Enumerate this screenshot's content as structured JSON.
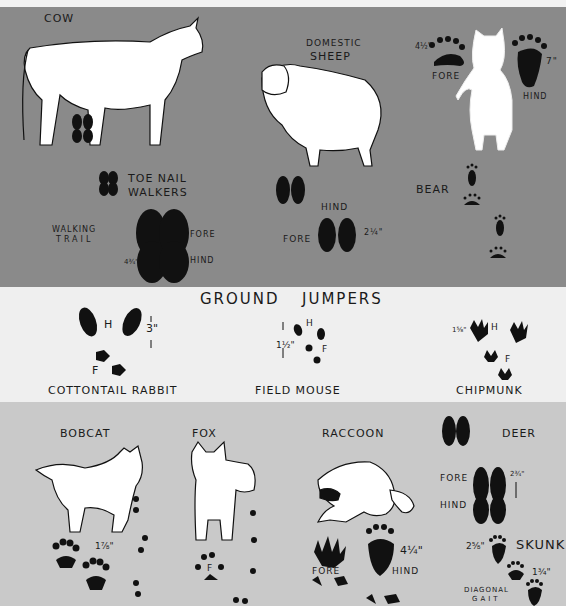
{
  "sections": {
    "hoofed": {
      "cow": {
        "label": "COW"
      },
      "sheep": {
        "label_line1": "DOMESTIC",
        "label_line2": "SHEEP",
        "fore": "FORE",
        "hind": "HIND",
        "size": "2¼\""
      },
      "toe_nail": {
        "line1": "TOE NAIL",
        "line2": "WALKERS"
      },
      "walking_trail": {
        "line1": "WALKING",
        "line2": "TRAIL",
        "fore": "FORE",
        "hind": "HIND",
        "size": "4¾\""
      },
      "bear": {
        "label": "BEAR",
        "fore": "FORE",
        "hind": "HIND",
        "fore_size": "4½\"",
        "hind_size": "7\""
      }
    },
    "ground_jumpers": {
      "title_1": "GROUND",
      "title_2": "JUMPERS",
      "rabbit": {
        "label": "COTTONTAIL RABBIT",
        "h": "H",
        "f": "F",
        "size": "3\""
      },
      "mouse": {
        "label": "FIELD MOUSE",
        "h": "H",
        "f": "F",
        "size": "1½\""
      },
      "chipmunk": {
        "label": "CHIPMUNK",
        "h": "H",
        "f": "F",
        "size": "1⅝\""
      }
    },
    "others": {
      "bobcat": {
        "label": "BOBCAT",
        "size": "1⅞\""
      },
      "fox": {
        "label": "FOX",
        "f": "F"
      },
      "raccoon": {
        "label": "RACCOON",
        "fore": "FORE",
        "hind": "HIND",
        "size": "4¼\""
      },
      "deer": {
        "label": "DEER",
        "fore": "FORE",
        "hind": "HIND",
        "size": "2¾\""
      },
      "skunk": {
        "label": "SKUNK",
        "size_a": "2⅝\"",
        "size_b": "1¾\"",
        "gait_line1": "DIAGONAL",
        "gait_line2": "GAIT"
      }
    }
  },
  "colors": {
    "top_band": "#8a8a8a",
    "mid_band": "#efefef",
    "bottom_band": "#c9c9c9",
    "ink": "#1a1a1a"
  }
}
